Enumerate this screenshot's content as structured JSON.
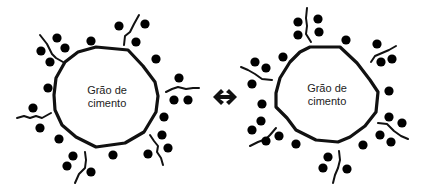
{
  "diagram": {
    "left_grain": {
      "label_line1": "Grão de",
      "label_line2": "cimento"
    },
    "right_grain": {
      "label_line1": "Grão de",
      "label_line2": "cimento"
    },
    "connector": "double-arrow-icon",
    "legend_symbols": {
      "positive": "plus-in-circle",
      "cross": "cross-in-circle"
    }
  }
}
